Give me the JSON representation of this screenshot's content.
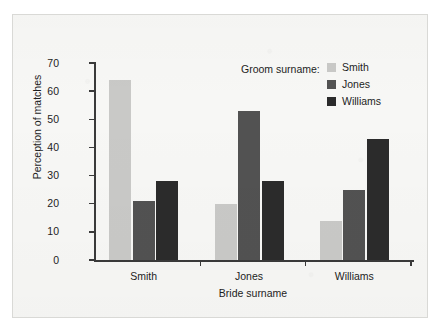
{
  "chart_data": {
    "type": "bar",
    "title": "",
    "xlabel": "Bride surname",
    "ylabel": "Perception of matches",
    "categories": [
      "Smith",
      "Jones",
      "Williams"
    ],
    "series": [
      {
        "name": "Smith",
        "values": [
          64,
          20,
          14
        ],
        "color": "#c9c9c7"
      },
      {
        "name": "Jones",
        "values": [
          21,
          53,
          25
        ],
        "color": "#525252"
      },
      {
        "name": "Williams",
        "values": [
          28,
          28,
          43
        ],
        "color": "#2b2b2b"
      }
    ],
    "legend_title": "Groom surname:",
    "legend_position": "top-right",
    "ylim": [
      0,
      70
    ],
    "yticks": [
      0,
      10,
      20,
      30,
      40,
      50,
      60,
      70
    ],
    "ytick_labels": [
      "0",
      "10",
      "20",
      "30",
      "40",
      "50",
      "60",
      "70"
    ],
    "grid": false,
    "axis_color": "#3a3a3a",
    "background": "#f7f7f5"
  },
  "axes": {
    "y_labels": [
      "70",
      "60",
      "50",
      "40",
      "30",
      "20",
      "10",
      "0"
    ],
    "y_title": "Perception of matches",
    "x_title": "Bride surname",
    "x_labels": [
      "Smith",
      "Jones",
      "Williams"
    ]
  },
  "legend": {
    "title": "Groom surname:",
    "entries": [
      {
        "label": "Smith",
        "color": "#c9c9c7"
      },
      {
        "label": "Jones",
        "color": "#525252"
      },
      {
        "label": "Williams",
        "color": "#2b2b2b"
      }
    ]
  }
}
